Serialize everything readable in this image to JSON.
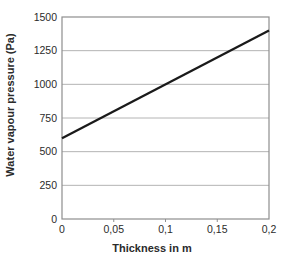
{
  "chart_data": {
    "type": "line",
    "title": "",
    "xlabel": "Thickness in m",
    "ylabel": "Water vapour pressure (Pa)",
    "xlim": [
      0,
      0.2
    ],
    "ylim": [
      0,
      1500
    ],
    "grid": "horizontal-only",
    "legend": "none",
    "x_ticks": {
      "values": [
        0,
        0.05,
        0.1,
        0.15,
        0.2
      ],
      "labels": [
        "0",
        "0,05",
        "0,1",
        "0,15",
        "0,2"
      ]
    },
    "y_ticks": {
      "values": [
        0,
        250,
        500,
        750,
        1000,
        1250,
        1500
      ],
      "labels": [
        "0",
        "250",
        "500",
        "750",
        "1000",
        "1250",
        "1500"
      ]
    },
    "series": [
      {
        "name": "water vapour pressure vs thickness",
        "x": [
          0,
          0.2
        ],
        "y": [
          600,
          1400
        ],
        "color": "#1a1a1a",
        "stroke_width": 2.3
      }
    ],
    "colors": {
      "grid": "#b4b4b4",
      "frame": "#8e8e8e",
      "tick": "#8e8e8e",
      "text": "#2b2b2b",
      "background": "#ffffff"
    }
  }
}
